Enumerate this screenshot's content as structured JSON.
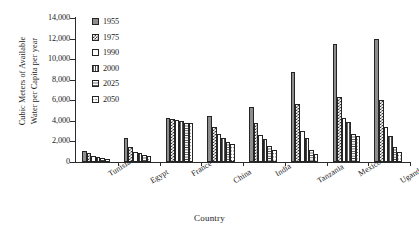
{
  "chart_data": {
    "type": "bar",
    "title": "",
    "xlabel": "Country",
    "ylabel": "Cubic Meters of Available Water per Capita per year",
    "ylabel_line1": "Cubic Meters of Available",
    "ylabel_line2": "Water per Capita per year",
    "ylim": [
      0,
      14000
    ],
    "yticks": [
      14000,
      12000,
      10000,
      8000,
      6000,
      4000,
      2000,
      0
    ],
    "ytick_labels": [
      "14,000",
      "12,000",
      "10,000",
      "8,000",
      "6,000",
      "4,000",
      "2,000",
      "0"
    ],
    "grid": false,
    "legend_position": "upper-left-inside",
    "categories": [
      "Tunisia",
      "Egypt",
      "France",
      "China",
      "India",
      "Tanzania",
      "Mexico",
      "Uganda"
    ],
    "series": [
      {
        "name": "1955",
        "pattern": "gray-dotted",
        "values": [
          1100,
          2350,
          4300,
          4450,
          5350,
          8800,
          11500,
          12000
        ]
      },
      {
        "name": "1975",
        "pattern": "checker",
        "values": [
          850,
          1500,
          4150,
          3450,
          3800,
          5650,
          6350,
          6050
        ]
      },
      {
        "name": "1990",
        "pattern": "cross-hatch",
        "values": [
          600,
          1000,
          4050,
          2700,
          2650,
          3000,
          4300,
          3450
        ]
      },
      {
        "name": "2000",
        "pattern": "vertical-lines",
        "values": [
          500,
          850,
          4000,
          2350,
          2200,
          2350,
          3850,
          2500
        ]
      },
      {
        "name": "2025",
        "pattern": "horizontal-lines",
        "values": [
          400,
          650,
          3800,
          1950,
          1550,
          1150,
          2700,
          1500
        ]
      },
      {
        "name": "2050",
        "pattern": "diagonal-cross",
        "values": [
          300,
          600,
          3750,
          1800,
          1200,
          750,
          2500,
          1000
        ]
      }
    ]
  },
  "axis": {
    "x_title": "Country",
    "y_title_line1": "Cubic Meters of Available",
    "y_title_line2": "Water per Capita per year"
  }
}
